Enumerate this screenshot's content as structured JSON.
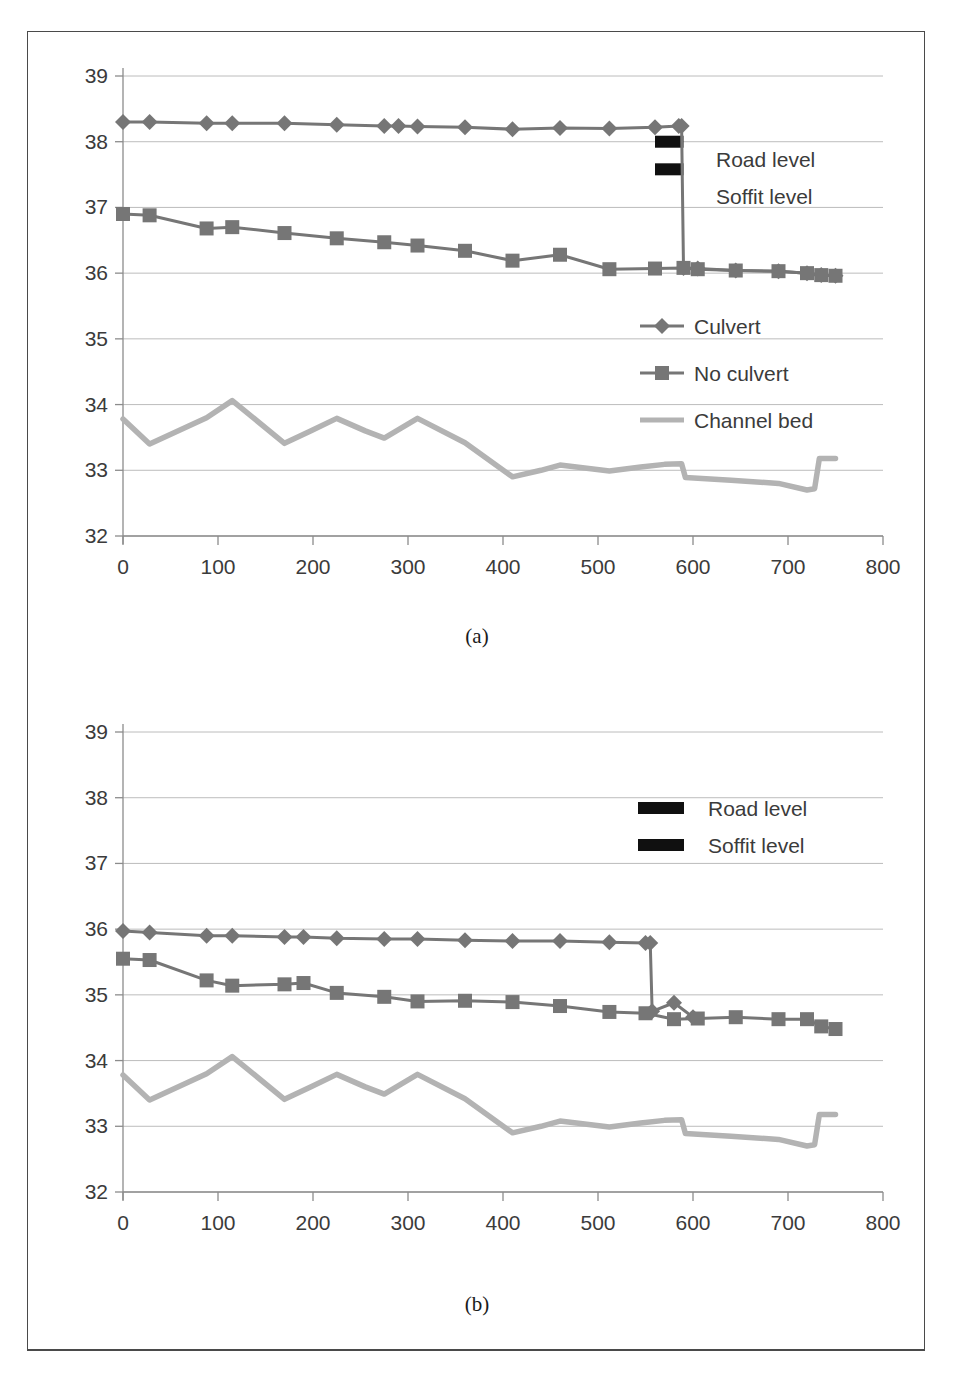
{
  "figure": {
    "caption_a": "(a)",
    "caption_b": "(b)"
  },
  "axis": {
    "y_ticks": [
      "32",
      "33",
      "34",
      "35",
      "36",
      "37",
      "38",
      "39"
    ],
    "x_ticks": [
      "0",
      "100",
      "200",
      "300",
      "400",
      "500",
      "600",
      "700",
      "800"
    ],
    "ylim": [
      32,
      39
    ],
    "xlim": [
      0,
      800
    ]
  },
  "colors": {
    "series_dark": "#767676",
    "series_light": "#b3b3b3",
    "grid": "#a9a9a9",
    "axis": "#8c8c8c",
    "marker_black": "#101010",
    "text": "#3b3b3b",
    "frame": "#4a4a4a"
  },
  "legend_a": {
    "items": [
      {
        "label": "Culvert",
        "marker": "diamond-marker-icon",
        "color": "#767676"
      },
      {
        "label": "No culvert",
        "marker": "square-marker-icon",
        "color": "#767676"
      },
      {
        "label": "Channel bed",
        "marker": "line-marker-icon",
        "color": "#b3b3b3"
      }
    ]
  },
  "annotations_a": {
    "road_level": "Road level",
    "soffit_level": "Soffit level"
  },
  "legend_b": {
    "items": [
      {
        "label": "Road level",
        "marker": "black-bar-icon",
        "color": "#101010"
      },
      {
        "label": "Soffit level",
        "marker": "black-bar-icon",
        "color": "#101010"
      }
    ]
  },
  "chart_data": [
    {
      "id": "chart-a",
      "type": "line",
      "title": "(a)",
      "xlabel": "",
      "ylabel": "",
      "xlim": [
        0,
        800
      ],
      "ylim": [
        32,
        39
      ],
      "xticks": [
        0,
        100,
        200,
        300,
        400,
        500,
        600,
        700,
        800
      ],
      "yticks": [
        32,
        33,
        34,
        35,
        36,
        37,
        38,
        39
      ],
      "grid": true,
      "legend_position": "middle-right",
      "series": [
        {
          "name": "Culvert",
          "marker": "diamond",
          "color": "#767676",
          "x": [
            0,
            28,
            88,
            115,
            170,
            225,
            275,
            290,
            310,
            360,
            410,
            460,
            512,
            560,
            585,
            588,
            590,
            605,
            645,
            690,
            720,
            735,
            750
          ],
          "y": [
            38.3,
            38.3,
            38.28,
            38.28,
            38.28,
            38.26,
            38.24,
            38.24,
            38.23,
            38.22,
            38.19,
            38.21,
            38.2,
            38.22,
            38.24,
            38.24,
            36.08,
            36.07,
            36.04,
            36.03,
            36.0,
            35.97,
            35.96
          ]
        },
        {
          "name": "No culvert",
          "marker": "square",
          "color": "#767676",
          "x": [
            0,
            28,
            88,
            115,
            170,
            225,
            275,
            310,
            360,
            410,
            460,
            512,
            560,
            590,
            605,
            645,
            690,
            720,
            735,
            750
          ],
          "y": [
            36.9,
            36.88,
            36.68,
            36.7,
            36.61,
            36.53,
            36.47,
            36.42,
            36.34,
            36.19,
            36.28,
            36.06,
            36.07,
            36.08,
            36.06,
            36.04,
            36.03,
            36.0,
            35.97,
            35.96
          ]
        },
        {
          "name": "Channel bed",
          "marker": "none",
          "color": "#b3b3b3",
          "x": [
            0,
            28,
            88,
            115,
            170,
            198,
            225,
            255,
            275,
            310,
            360,
            410,
            440,
            460,
            512,
            545,
            570,
            588,
            592,
            640,
            690,
            720,
            728,
            733,
            750
          ],
          "y": [
            33.78,
            33.4,
            33.8,
            34.06,
            33.41,
            33.6,
            33.79,
            33.6,
            33.49,
            33.79,
            33.42,
            32.9,
            33.0,
            33.08,
            32.99,
            33.05,
            33.09,
            33.1,
            32.89,
            32.85,
            32.8,
            32.7,
            32.72,
            33.18,
            33.18
          ]
        }
      ],
      "annotations": [
        {
          "text": "Road level",
          "type": "black-bar",
          "x_start": 560,
          "x_end": 590,
          "y": 38.0
        },
        {
          "text": "Soffit level",
          "type": "black-bar",
          "x_start": 560,
          "x_end": 590,
          "y": 37.58
        }
      ]
    },
    {
      "id": "chart-b",
      "type": "line",
      "title": "(b)",
      "xlabel": "",
      "ylabel": "",
      "xlim": [
        0,
        800
      ],
      "ylim": [
        32,
        39
      ],
      "xticks": [
        0,
        100,
        200,
        300,
        400,
        500,
        600,
        700,
        800
      ],
      "yticks": [
        32,
        33,
        34,
        35,
        36,
        37,
        38,
        39
      ],
      "grid": true,
      "legend_position": "upper-right",
      "series": [
        {
          "name": "Culvert",
          "marker": "diamond",
          "color": "#767676",
          "x": [
            0,
            28,
            88,
            115,
            170,
            190,
            225,
            275,
            310,
            360,
            410,
            460,
            512,
            550,
            555,
            557,
            580,
            600
          ],
          "y": [
            35.97,
            35.95,
            35.9,
            35.9,
            35.88,
            35.88,
            35.86,
            35.85,
            35.85,
            35.83,
            35.82,
            35.82,
            35.8,
            35.79,
            35.79,
            34.75,
            34.88,
            34.66
          ]
        },
        {
          "name": "No culvert",
          "marker": "square",
          "color": "#767676",
          "x": [
            0,
            28,
            88,
            115,
            170,
            190,
            225,
            275,
            310,
            360,
            410,
            460,
            512,
            550,
            580,
            605,
            645,
            690,
            720,
            735,
            750
          ],
          "y": [
            35.55,
            35.53,
            35.22,
            35.14,
            35.16,
            35.18,
            35.03,
            34.97,
            34.9,
            34.91,
            34.89,
            34.83,
            34.74,
            34.72,
            34.63,
            34.64,
            34.66,
            34.63,
            34.63,
            34.52,
            34.48
          ]
        },
        {
          "name": "Channel bed",
          "marker": "none",
          "color": "#b3b3b3",
          "x": [
            0,
            28,
            88,
            115,
            170,
            198,
            225,
            255,
            275,
            310,
            360,
            410,
            440,
            460,
            512,
            545,
            570,
            588,
            592,
            640,
            690,
            720,
            728,
            733,
            750
          ],
          "y": [
            33.78,
            33.4,
            33.8,
            34.06,
            33.41,
            33.6,
            33.79,
            33.6,
            33.49,
            33.79,
            33.42,
            32.9,
            33.0,
            33.08,
            32.99,
            33.05,
            33.09,
            33.1,
            32.89,
            32.85,
            32.8,
            32.7,
            32.72,
            33.18,
            33.18
          ]
        }
      ],
      "annotations": [
        {
          "text": "Road level",
          "type": "black-bar",
          "y": 38.0
        },
        {
          "text": "Soffit level",
          "type": "black-bar",
          "y": 37.55
        }
      ]
    }
  ]
}
